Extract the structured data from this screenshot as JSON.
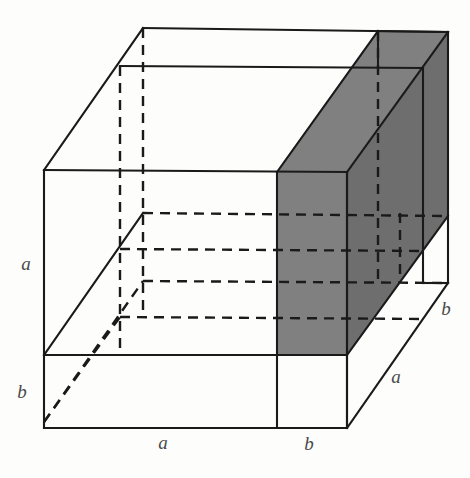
{
  "figure": {
    "type": "geometric-diagram-3d",
    "background_color": "#fdfdfc",
    "line_color": "#1a1a1a",
    "shade_color": "#808080",
    "shade_color_dark": "#6e6e6e",
    "label_color": "#4a4a4a",
    "edge_lengths": {
      "a": "a",
      "b": "b"
    },
    "labels": [
      {
        "name": "left-vertical-a",
        "text": "a",
        "x": 26,
        "y": 270
      },
      {
        "name": "left-vertical-b",
        "text": "b",
        "x": 22,
        "y": 398
      },
      {
        "name": "bottom-front-a",
        "text": "a",
        "x": 163,
        "y": 449
      },
      {
        "name": "bottom-front-b",
        "text": "b",
        "x": 309,
        "y": 450
      },
      {
        "name": "right-depth-a",
        "text": "a",
        "x": 396,
        "y": 383
      },
      {
        "name": "right-depth-b",
        "text": "b",
        "x": 446,
        "y": 315
      }
    ],
    "solid_edges": [
      {
        "name": "front-face-left",
        "x1": 44,
        "y1": 170,
        "x2": 44,
        "y2": 428
      },
      {
        "name": "front-face-top",
        "x1": 44,
        "y1": 170,
        "x2": 347,
        "y2": 172
      },
      {
        "name": "front-face-bottom",
        "x1": 44,
        "y1": 428,
        "x2": 347,
        "y2": 428
      },
      {
        "name": "front-face-right",
        "x1": 347,
        "y1": 172,
        "x2": 347,
        "y2": 428
      },
      {
        "name": "front-horizontal-split",
        "x1": 44,
        "y1": 355,
        "x2": 347,
        "y2": 355
      },
      {
        "name": "front-vertical-split",
        "x1": 277,
        "y1": 172,
        "x2": 277,
        "y2": 428
      },
      {
        "name": "top-left-diagonal",
        "x1": 44,
        "y1": 170,
        "x2": 143,
        "y2": 28
      },
      {
        "name": "top-back-edge",
        "x1": 143,
        "y1": 28,
        "x2": 448,
        "y2": 32
      },
      {
        "name": "upper-inner-horizontal",
        "x1": 120,
        "y1": 66,
        "x2": 423,
        "y2": 68
      },
      {
        "name": "interior-diagonal-front",
        "x1": 44,
        "y1": 355,
        "x2": 143,
        "y2": 213
      },
      {
        "name": "right-back-vertical",
        "x1": 448,
        "y1": 32,
        "x2": 448,
        "y2": 283
      },
      {
        "name": "right-inner-vertical",
        "x1": 423,
        "y1": 68,
        "x2": 423,
        "y2": 283
      },
      {
        "name": "right-diagonal-upper",
        "x1": 347,
        "y1": 172,
        "x2": 448,
        "y2": 32
      },
      {
        "name": "right-diagonal-mid",
        "x1": 347,
        "y1": 355,
        "x2": 448,
        "y2": 216
      },
      {
        "name": "right-diagonal-lower",
        "x1": 347,
        "y1": 428,
        "x2": 448,
        "y2": 283
      },
      {
        "name": "right-bottom-edge",
        "x1": 423,
        "y1": 283,
        "x2": 448,
        "y2": 283
      },
      {
        "name": "slab-top-back-diag",
        "x1": 277,
        "y1": 172,
        "x2": 378,
        "y2": 31
      },
      {
        "name": "slab-top-right-edge",
        "x1": 378,
        "y1": 31,
        "x2": 448,
        "y2": 32
      },
      {
        "name": "slab-right-vertical-upper",
        "x1": 378,
        "y1": 31,
        "x2": 378,
        "y2": 68
      },
      {
        "name": "slab-inner-vertical",
        "x1": 347,
        "y1": 172,
        "x2": 347,
        "y2": 428
      }
    ],
    "dashed_edges": [
      {
        "name": "hidden-vertical-near-left",
        "x1": 120,
        "y1": 66,
        "x2": 120,
        "y2": 355
      },
      {
        "name": "hidden-vertical-inner",
        "x1": 143,
        "y1": 28,
        "x2": 143,
        "y2": 317
      },
      {
        "name": "hidden-horizontal-1",
        "x1": 143,
        "y1": 213,
        "x2": 448,
        "y2": 216
      },
      {
        "name": "hidden-horizontal-2",
        "x1": 120,
        "y1": 249,
        "x2": 425,
        "y2": 251
      },
      {
        "name": "hidden-horizontal-3",
        "x1": 143,
        "y1": 281,
        "x2": 448,
        "y2": 283
      },
      {
        "name": "hidden-horizontal-4",
        "x1": 120,
        "y1": 317,
        "x2": 425,
        "y2": 319
      },
      {
        "name": "hidden-diagonal-bottom-left",
        "x1": 44,
        "y1": 422,
        "x2": 143,
        "y2": 281
      },
      {
        "name": "hidden-diagonal-lower",
        "x1": 44,
        "y1": 422,
        "x2": 120,
        "y2": 317
      },
      {
        "name": "hidden-back-right-vertical",
        "x1": 378,
        "y1": 31,
        "x2": 378,
        "y2": 283
      },
      {
        "name": "hidden-inner-right-vertical",
        "x1": 400,
        "y1": 213,
        "x2": 400,
        "y2": 283
      }
    ],
    "shaded_faces": [
      {
        "name": "slab-front-face",
        "points": "277,172 347,172 347,355 277,355",
        "tone": "mid"
      },
      {
        "name": "slab-top-face",
        "points": "277,172 378,31 448,32 347,172",
        "tone": "mid"
      },
      {
        "name": "slab-right-face",
        "points": "347,172 448,32 448,216 347,355",
        "tone": "dark"
      }
    ]
  }
}
